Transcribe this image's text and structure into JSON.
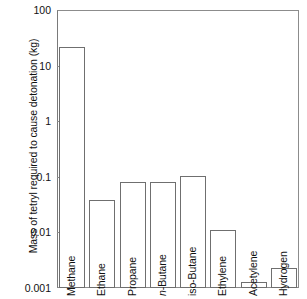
{
  "chart_data": {
    "type": "bar",
    "title": "",
    "xlabel": "",
    "ylabel": "Mass of tetryl required to cause detonation (kg)",
    "yscale": "log",
    "ylim": [
      0.001,
      100
    ],
    "ytick_labels": [
      "100",
      "10",
      "1",
      "0.1",
      "0.01",
      "0.001"
    ],
    "ytick_values": [
      100,
      10,
      1,
      0.1,
      0.01,
      0.001
    ],
    "grid": false,
    "legend": "none",
    "categories": [
      "Methane",
      "Ethane",
      "Propane",
      "n-Butane",
      "iso-Butane",
      "Ethylene",
      "Acetylene",
      "Hydrogen"
    ],
    "values": [
      22,
      0.038,
      0.081,
      0.082,
      0.105,
      0.011,
      0.0013,
      0.0023
    ],
    "bars": [
      {
        "label": "Methane",
        "label_prefix_italic": "",
        "label_rest": "Methane",
        "value": 22
      },
      {
        "label": "Ethane",
        "label_prefix_italic": "",
        "label_rest": "Ethane",
        "value": 0.038
      },
      {
        "label": "Propane",
        "label_prefix_italic": "",
        "label_rest": "Propane",
        "value": 0.081
      },
      {
        "label": "n-Butane",
        "label_prefix_italic": "n",
        "label_rest": "-Butane",
        "value": 0.082
      },
      {
        "label": "iso-Butane",
        "label_prefix_italic": "",
        "label_rest": "iso-Butane",
        "value": 0.105
      },
      {
        "label": "Ethylene",
        "label_prefix_italic": "",
        "label_rest": "Ethylene",
        "value": 0.011
      },
      {
        "label": "Acetylene",
        "label_prefix_italic": "",
        "label_rest": "Acetylene",
        "value": 0.0013
      },
      {
        "label": "Hydrogen",
        "label_prefix_italic": "",
        "label_rest": "Hydrogen",
        "value": 0.0023
      }
    ]
  },
  "colors": {
    "bar_fill": "#ffffff",
    "bar_stroke": "#6f6f6f",
    "axis": "#8c8c8c",
    "text": "#111111",
    "background": "#ffffff"
  }
}
